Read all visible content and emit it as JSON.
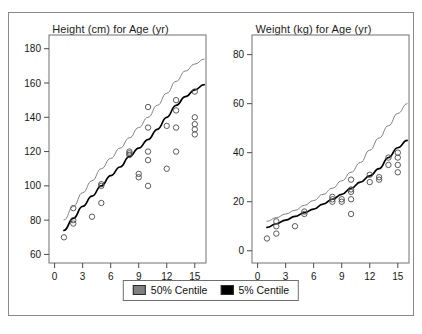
{
  "figure": {
    "background_color": "#ffffff",
    "frame_color": "#8a8a8a"
  },
  "legend": {
    "entries": [
      {
        "label": "50% Centile",
        "color": "#808080"
      },
      {
        "label": "5% Centile",
        "color": "#000000"
      }
    ]
  },
  "chart_data": [
    {
      "type": "scatter",
      "id": "height-for-age",
      "title": "Height (cm) for Age (yr)",
      "xlabel": "",
      "ylabel": "",
      "xlim": [
        -0.6,
        16.2
      ],
      "ylim": [
        55,
        188
      ],
      "grid": false,
      "legend_position": "bottom-center-shared",
      "xticks": [
        0,
        3,
        6,
        9,
        12,
        15
      ],
      "yticks": [
        60,
        80,
        100,
        120,
        140,
        160,
        180
      ],
      "xticklabels": [
        "0",
        "3",
        "6",
        "9",
        "12",
        "15"
      ],
      "yticklabels": [
        "60",
        "80",
        "100",
        "120",
        "140",
        "160",
        "180"
      ],
      "series": [
        {
          "name": "50% Centile",
          "type": "line",
          "color": "#808080",
          "x": [
            1,
            2,
            3,
            4,
            5,
            6,
            7,
            8,
            9,
            10,
            11,
            12,
            13,
            14,
            15,
            16
          ],
          "y": [
            80,
            88,
            96,
            103,
            110,
            116,
            122,
            128,
            134,
            140,
            147,
            154,
            161,
            167,
            171,
            174
          ]
        },
        {
          "name": "5% Centile",
          "type": "line",
          "color": "#000000",
          "x": [
            1,
            2,
            3,
            4,
            5,
            6,
            7,
            8,
            9,
            10,
            11,
            12,
            13,
            14,
            15,
            16
          ],
          "y": [
            74,
            81,
            88,
            94,
            100,
            106,
            111,
            117,
            122,
            127,
            133,
            140,
            147,
            152,
            156,
            159
          ]
        },
        {
          "name": "Observations",
          "type": "scatter",
          "color": "#4a4a4a",
          "points": [
            [
              1,
              70
            ],
            [
              2,
              78
            ],
            [
              2,
              80
            ],
            [
              2,
              87
            ],
            [
              4,
              82
            ],
            [
              5,
              90
            ],
            [
              5,
              100
            ],
            [
              5,
              101
            ],
            [
              8,
              118
            ],
            [
              8,
              119
            ],
            [
              8,
              120
            ],
            [
              9,
              105
            ],
            [
              9,
              107
            ],
            [
              10,
              100
            ],
            [
              10,
              115
            ],
            [
              10,
              120
            ],
            [
              10,
              134
            ],
            [
              10,
              146
            ],
            [
              12,
              110
            ],
            [
              12,
              135
            ],
            [
              13,
              120
            ],
            [
              13,
              134
            ],
            [
              13,
              144
            ],
            [
              13,
              150
            ],
            [
              15,
              130
            ],
            [
              15,
              133
            ],
            [
              15,
              136
            ],
            [
              15,
              140
            ],
            [
              15,
              155
            ]
          ]
        }
      ]
    },
    {
      "type": "scatter",
      "id": "weight-for-age",
      "title": "Weight (kg) for Age (yr)",
      "xlabel": "",
      "ylabel": "",
      "xlim": [
        -0.6,
        16.2
      ],
      "ylim": [
        -5,
        88
      ],
      "grid": false,
      "legend_position": "bottom-center-shared",
      "xticks": [
        0,
        3,
        6,
        9,
        12,
        15
      ],
      "yticks": [
        0,
        20,
        40,
        60,
        80
      ],
      "xticklabels": [
        "0",
        "3",
        "6",
        "9",
        "12",
        "15"
      ],
      "yticklabels": [
        "0",
        "20",
        "40",
        "60",
        "80"
      ],
      "series": [
        {
          "name": "50% Centile",
          "type": "line",
          "color": "#808080",
          "x": [
            1,
            2,
            3,
            4,
            5,
            6,
            7,
            8,
            9,
            10,
            11,
            12,
            13,
            14,
            15,
            16
          ],
          "y": [
            12,
            13.5,
            15,
            16.5,
            18.5,
            20.5,
            23,
            25.5,
            28.5,
            32,
            36,
            41,
            46,
            51,
            56,
            60
          ]
        },
        {
          "name": "5% Centile",
          "type": "line",
          "color": "#000000",
          "x": [
            1,
            2,
            3,
            4,
            5,
            6,
            7,
            8,
            9,
            10,
            11,
            12,
            13,
            14,
            15,
            16
          ],
          "y": [
            9.5,
            11,
            12.5,
            14,
            15.5,
            17,
            19,
            21,
            23,
            25.5,
            28,
            30.5,
            33.5,
            38,
            42,
            45
          ]
        },
        {
          "name": "Observations",
          "type": "scatter",
          "color": "#4a4a4a",
          "points": [
            [
              1,
              5
            ],
            [
              2,
              7
            ],
            [
              2,
              10
            ],
            [
              2,
              12
            ],
            [
              4,
              10
            ],
            [
              5,
              15
            ],
            [
              5,
              16
            ],
            [
              8,
              20
            ],
            [
              8,
              21
            ],
            [
              8,
              22
            ],
            [
              9,
              20
            ],
            [
              9,
              21
            ],
            [
              10,
              15
            ],
            [
              10,
              21
            ],
            [
              10,
              24
            ],
            [
              10,
              25
            ],
            [
              10,
              29
            ],
            [
              12,
              28
            ],
            [
              12,
              31
            ],
            [
              13,
              29
            ],
            [
              13,
              30
            ],
            [
              14,
              35
            ],
            [
              14,
              38
            ],
            [
              15,
              32
            ],
            [
              15,
              35
            ],
            [
              15,
              38
            ],
            [
              15,
              40
            ]
          ]
        }
      ]
    }
  ]
}
